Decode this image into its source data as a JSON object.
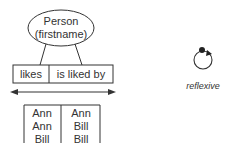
{
  "entity": {
    "name": "Person",
    "attribute": "(firstname)"
  },
  "relationship": {
    "roles": [
      "likes",
      "is liked by"
    ]
  },
  "population": {
    "rows": [
      [
        "Ann",
        "Ann"
      ],
      [
        "Ann",
        "Bill"
      ],
      [
        "Bill",
        "Bill"
      ]
    ]
  },
  "constraint": {
    "label": "reflexive",
    "icon": "reflexive-ring-icon"
  },
  "colors": {
    "stroke": "#333333",
    "text": "#333333",
    "background": "#ffffff"
  }
}
